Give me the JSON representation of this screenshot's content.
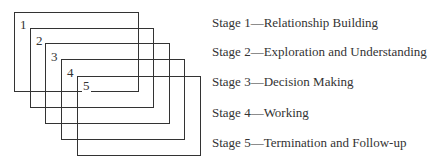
{
  "diagram": {
    "type": "overlapping-stages",
    "stages": [
      {
        "number": "1",
        "label": "Stage 1—Relationship Building"
      },
      {
        "number": "2",
        "label": "Stage 2—Exploration and Understanding"
      },
      {
        "number": "3",
        "label": "Stage 3—Decision Making"
      },
      {
        "number": "4",
        "label": "Stage 4—Working"
      },
      {
        "number": "5",
        "label": "Stage 5—Termination and Follow-up"
      }
    ],
    "colors": {
      "line": "#333333",
      "text": "#333333",
      "background": "#ffffff"
    }
  }
}
